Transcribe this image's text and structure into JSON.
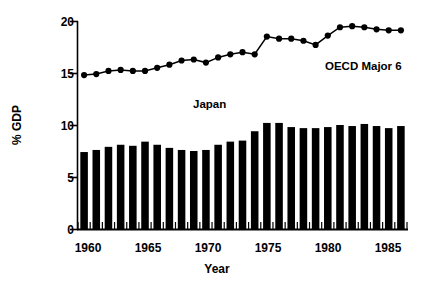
{
  "chart_data": {
    "type": "bar",
    "title": "",
    "xlabel": "Year",
    "ylabel": "% GDP",
    "xlim": [
      1959.3,
      1986.7
    ],
    "ylim": [
      0,
      20
    ],
    "yticks": [
      0,
      5,
      10,
      15,
      20
    ],
    "xticks": [
      1960,
      1965,
      1970,
      1975,
      1980,
      1985
    ],
    "grid": false,
    "legend_position": "inline-annotation",
    "x": [
      1960,
      1961,
      1962,
      1963,
      1964,
      1965,
      1966,
      1967,
      1968,
      1969,
      1970,
      1971,
      1972,
      1973,
      1974,
      1975,
      1976,
      1977,
      1978,
      1979,
      1980,
      1981,
      1982,
      1983,
      1984,
      1985,
      1986
    ],
    "series": [
      {
        "name": "Japan",
        "type": "bar",
        "color": "#000000",
        "values": [
          7.4,
          7.6,
          7.9,
          8.1,
          8.0,
          8.4,
          8.1,
          7.8,
          7.6,
          7.5,
          7.6,
          8.1,
          8.4,
          8.5,
          9.4,
          10.2,
          10.2,
          9.8,
          9.7,
          9.7,
          9.8,
          10.0,
          9.9,
          10.1,
          9.9,
          9.7,
          9.9
        ]
      },
      {
        "name": "OECD Major 6",
        "type": "line",
        "color": "#000000",
        "marker": "circle",
        "values": [
          14.8,
          14.9,
          15.2,
          15.3,
          15.2,
          15.2,
          15.5,
          15.8,
          16.2,
          16.3,
          16.0,
          16.5,
          16.8,
          17.0,
          16.8,
          18.5,
          18.3,
          18.3,
          18.1,
          17.7,
          18.6,
          19.4,
          19.5,
          19.4,
          19.2,
          19.1,
          19.1
        ]
      }
    ]
  },
  "labels": {
    "ylabel": "% GDP",
    "xlabel": "Year",
    "oecd": "OECD Major 6",
    "japan": "Japan",
    "y_ticks": [
      "20",
      "15",
      "10",
      "5",
      "0"
    ],
    "x_ticks": [
      "1960",
      "1965",
      "1970",
      "1975",
      "1980",
      "1985"
    ]
  }
}
